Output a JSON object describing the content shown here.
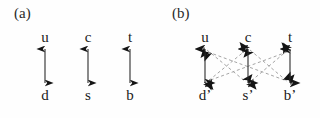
{
  "figure": {
    "background_color": "#fefefe",
    "ink_color": "#1a1a1a",
    "dashed_color": "#9a9a9a",
    "width": 320,
    "height": 118
  },
  "panels": [
    {
      "id": "a",
      "label": "(a)",
      "columns_x": [
        45,
        88,
        130
      ],
      "top_row_y": 30,
      "bottom_row_y": 88,
      "arrow_top_y": 48,
      "arrow_bottom_y": 84,
      "top_labels": [
        "u",
        "c",
        "t"
      ],
      "bottom_labels": [
        "d",
        "s",
        "b"
      ],
      "bottom_primes": [
        "",
        "",
        ""
      ],
      "vertical_arrows": [
        {
          "from": "u",
          "to": "d",
          "style": "solid",
          "heads": "both"
        },
        {
          "from": "c",
          "to": "s",
          "style": "solid",
          "heads": "both"
        },
        {
          "from": "t",
          "to": "b",
          "style": "solid",
          "heads": "both"
        }
      ],
      "diagonal_arrows": []
    },
    {
      "id": "b",
      "label": "(b)",
      "columns_x": [
        45,
        88,
        130
      ],
      "top_row_y": 30,
      "bottom_row_y": 88,
      "arrow_top_y": 48,
      "arrow_bottom_y": 84,
      "top_labels": [
        "u",
        "c",
        "t"
      ],
      "bottom_labels": [
        "d",
        "s",
        "b"
      ],
      "bottom_primes": [
        "’",
        "’",
        "’"
      ],
      "vertical_arrows": [
        {
          "from": "u",
          "to": "d’",
          "style": "solid",
          "heads": "both"
        },
        {
          "from": "c",
          "to": "s’",
          "style": "solid",
          "heads": "both"
        },
        {
          "from": "t",
          "to": "b’",
          "style": "solid",
          "heads": "both"
        }
      ],
      "diagonal_arrows": [
        {
          "from": "u",
          "to": "s’",
          "style": "dashed",
          "heads": "both"
        },
        {
          "from": "c",
          "to": "d’",
          "style": "dashed",
          "heads": "both"
        },
        {
          "from": "c",
          "to": "b’",
          "style": "dashed",
          "heads": "both"
        },
        {
          "from": "t",
          "to": "s’",
          "style": "dashed",
          "heads": "both"
        },
        {
          "from": "u",
          "to": "b’",
          "style": "dashed",
          "heads": "both"
        },
        {
          "from": "t",
          "to": "d’",
          "style": "dashed",
          "heads": "both"
        }
      ]
    }
  ]
}
